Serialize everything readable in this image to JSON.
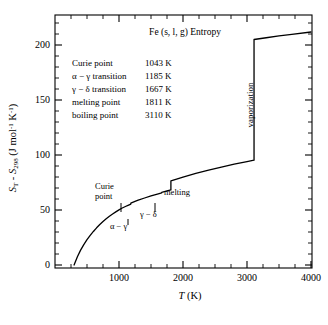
{
  "chart_data": {
    "type": "line",
    "title": "Fe (s, l, g) Entropy",
    "xlabel": "T (K)",
    "ylabel": "S_T - S_298 (J mol^-1 K^-1)",
    "ylabel_parts": {
      "s1": "S",
      "sub1": "T",
      "dash": " -",
      "s2": "S",
      "sub2": "298",
      "units_open": " (J mol",
      "sup1": "-1",
      "units_mid": " K",
      "sup2": "-1",
      "units_close": ")"
    },
    "xlim": [
      200,
      4100
    ],
    "ylim": [
      0,
      218
    ],
    "xticks": [
      1000,
      2000,
      3000,
      4000
    ],
    "xtick_labels": [
      "1000",
      "2000",
      "3000",
      "4000"
    ],
    "yticks": [
      0,
      50,
      100,
      150,
      200
    ],
    "ytick_labels": [
      "0",
      "50",
      "100",
      "150",
      "200"
    ],
    "x_minor_step": 250,
    "y_minor_step": 10,
    "grid": false,
    "legend_position": "none",
    "series": [
      {
        "name": "Fe entropy increment",
        "points": [
          [
            298,
            0
          ],
          [
            350,
            7.5
          ],
          [
            400,
            13.5
          ],
          [
            450,
            18.5
          ],
          [
            500,
            23
          ],
          [
            550,
            27
          ],
          [
            600,
            30.5
          ],
          [
            650,
            33.8
          ],
          [
            700,
            36.8
          ],
          [
            750,
            39.5
          ],
          [
            800,
            42
          ],
          [
            850,
            44.3
          ],
          [
            900,
            46.4
          ],
          [
            950,
            48.3
          ],
          [
            1000,
            50.1
          ],
          [
            1043,
            51.6
          ],
          [
            1100,
            53.2
          ],
          [
            1150,
            54.5
          ],
          [
            1185,
            55.4
          ],
          [
            1185,
            56.3
          ],
          [
            1250,
            57.8
          ],
          [
            1300,
            58.9
          ],
          [
            1400,
            60.9
          ],
          [
            1500,
            62.8
          ],
          [
            1600,
            64.5
          ],
          [
            1667,
            65.6
          ],
          [
            1667,
            66.0
          ],
          [
            1750,
            67.3
          ],
          [
            1811,
            68.2
          ],
          [
            1811,
            76.5
          ],
          [
            1900,
            78.1
          ],
          [
            2000,
            79.9
          ],
          [
            2200,
            83.2
          ],
          [
            2400,
            86.2
          ],
          [
            2600,
            89.0
          ],
          [
            2800,
            91.6
          ],
          [
            3000,
            94.0
          ],
          [
            3110,
            95.3
          ],
          [
            3110,
            205.0
          ],
          [
            3300,
            206.6
          ],
          [
            3500,
            208.2
          ],
          [
            3700,
            209.7
          ],
          [
            4000,
            211.8
          ]
        ]
      }
    ],
    "transitions": [
      {
        "label": "Curie point",
        "temperature": 1043,
        "unit": "K",
        "value_text": "1043 K"
      },
      {
        "label": "α − γ transition",
        "temperature": 1185,
        "unit": "K",
        "value_text": "1185 K"
      },
      {
        "label": "γ − δ transition",
        "temperature": 1667,
        "unit": "K",
        "value_text": "1667 K"
      },
      {
        "label": "melting point",
        "temperature": 1811,
        "unit": "K",
        "value_text": "1811 K"
      },
      {
        "label": "boiling point",
        "temperature": 3110,
        "unit": "K",
        "value_text": "3110 K"
      }
    ],
    "annotations": [
      {
        "name": "curie-point",
        "text_line1": "Curie",
        "text_line2": "point"
      },
      {
        "name": "alpha-gamma",
        "text": "α − γ"
      },
      {
        "name": "gamma-delta",
        "text": "γ − δ"
      },
      {
        "name": "melting",
        "text": "melting"
      },
      {
        "name": "vaporization",
        "text": "vaporization"
      }
    ]
  },
  "colors": {
    "line": "#000000",
    "axis": "#000000",
    "background": "#ffffff",
    "text": "#000000"
  }
}
